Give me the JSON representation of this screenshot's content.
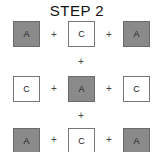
{
  "title": "STEP 2",
  "grid": [
    [
      {
        "label": "A",
        "shade": "dark"
      },
      {
        "label": "C",
        "shade": "light"
      },
      {
        "label": "A",
        "shade": "dark"
      }
    ],
    [
      {
        "label": "C",
        "shade": "light"
      },
      {
        "label": "A",
        "shade": "dark"
      },
      {
        "label": "C",
        "shade": "light"
      }
    ],
    [
      {
        "label": "A",
        "shade": "dark"
      },
      {
        "label": "C",
        "shade": "light"
      },
      {
        "label": "A",
        "shade": "dark"
      }
    ]
  ],
  "operator": "+",
  "colors": {
    "dark": "#8a8a8a",
    "light": "#ffffff"
  }
}
